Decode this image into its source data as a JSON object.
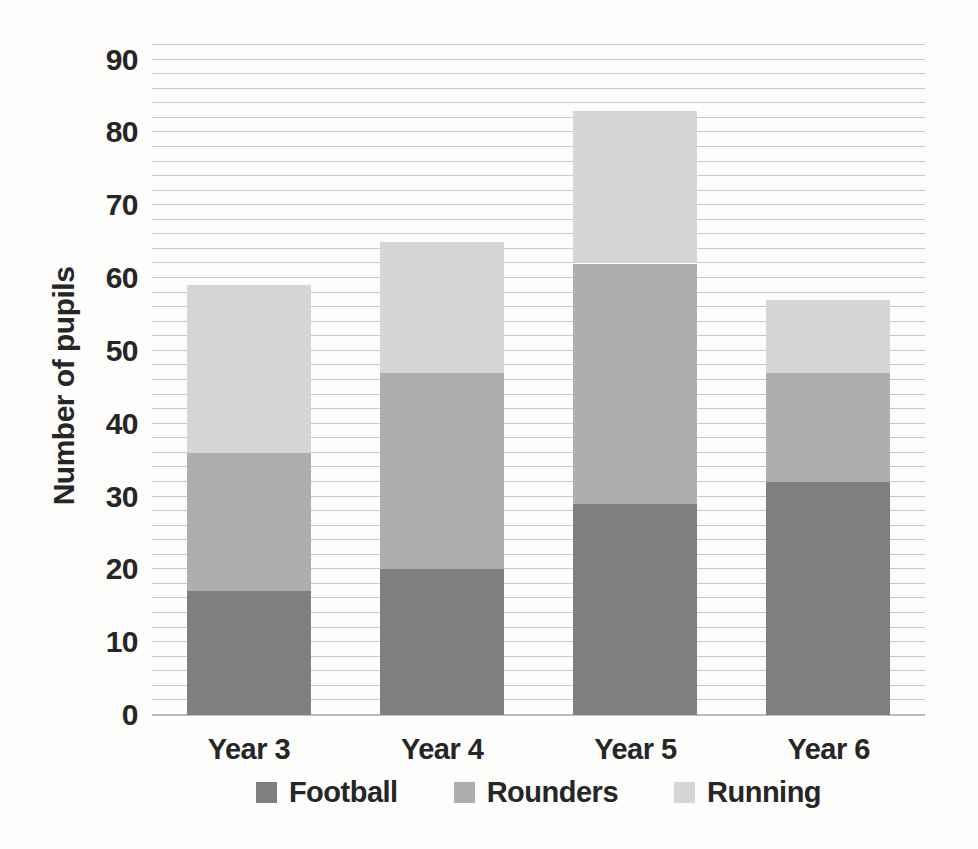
{
  "chart_data": {
    "type": "bar",
    "stacked": true,
    "categories": [
      "Year 3",
      "Year 4",
      "Year 5",
      "Year 6"
    ],
    "series": [
      {
        "name": "Football",
        "color": "#7f7f7f",
        "values": [
          17,
          20,
          29,
          32
        ]
      },
      {
        "name": "Rounders",
        "color": "#aeaeae",
        "values": [
          19,
          27,
          33,
          15
        ]
      },
      {
        "name": "Running",
        "color": "#d6d6d6",
        "values": [
          23,
          18,
          21,
          10
        ]
      }
    ],
    "title": "",
    "xlabel": "",
    "ylabel": "Number of pupils",
    "ylim": [
      0,
      92
    ],
    "y_major_ticks": [
      0,
      10,
      20,
      30,
      40,
      50,
      60,
      70,
      80,
      90
    ],
    "y_minor_step": 2,
    "grid": "horizontal-minor",
    "legend_position": "bottom",
    "gridline_color": "#c9c9c9",
    "axis_line_color": "#bdbdbd",
    "text_color": "#262626",
    "background_color": "#fdfdfc"
  }
}
